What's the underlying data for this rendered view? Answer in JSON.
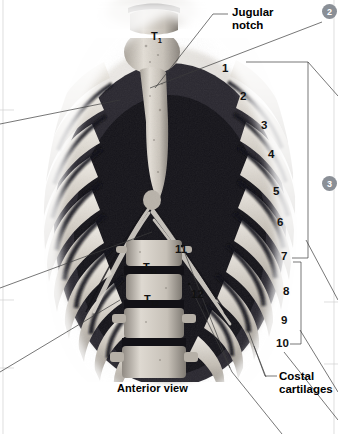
{
  "figure": {
    "caption": "Anterior view",
    "view_kind": "photographic anatomical specimen, grayscale"
  },
  "callouts": [
    {
      "id": "jugular-notch",
      "text": "Jugular\nnotch",
      "x": 232,
      "y": 6
    },
    {
      "id": "costal-cartilages",
      "text": "Costal\ncartilages",
      "x": 279,
      "y": 370
    }
  ],
  "rib_numbers": [
    {
      "label": "1",
      "x": 222,
      "y": 62
    },
    {
      "label": "2",
      "x": 240,
      "y": 90
    },
    {
      "label": "3",
      "x": 261,
      "y": 119
    },
    {
      "label": "4",
      "x": 268,
      "y": 148
    },
    {
      "label": "5",
      "x": 273,
      "y": 185
    },
    {
      "label": "6",
      "x": 277,
      "y": 216
    },
    {
      "label": "7",
      "x": 281,
      "y": 250
    },
    {
      "label": "8",
      "x": 283,
      "y": 285
    },
    {
      "label": "9",
      "x": 281,
      "y": 314
    },
    {
      "label": "10",
      "x": 279,
      "y": 337
    },
    {
      "label": "11",
      "x": 175,
      "y": 243
    },
    {
      "label": "12",
      "x": 191,
      "y": 288
    }
  ],
  "vertebrae": [
    {
      "label": "T",
      "sub": "1",
      "x": 151,
      "y": 18
    },
    {
      "label": "T",
      "sub": "11",
      "x": 143,
      "y": 249
    },
    {
      "label": "T",
      "sub": "12",
      "x": 144,
      "y": 281
    }
  ],
  "badges": [
    {
      "label": "2",
      "x": 328,
      "y": 6
    },
    {
      "label": "3",
      "x": 328,
      "y": 178
    }
  ],
  "colors": {
    "bone_light": "#dedad3",
    "bone_mid": "#b4aea6",
    "bone_shadow": "#6f6a64",
    "intercostal_dark": "#16151a",
    "leader_line": "#3c3c3c",
    "badge_gray": "#8a8f96",
    "background": "#ffffff"
  }
}
